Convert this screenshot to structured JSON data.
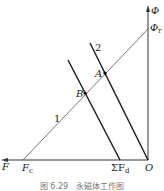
{
  "axes": {
    "y_label": "Φ",
    "y_intercept_label": "Φ",
    "y_intercept_sub": "r",
    "x_label": "F",
    "x_intercept_label": "F",
    "x_intercept_sub": "c",
    "origin_label": "O",
    "sum_fd_label": "ΣF",
    "sum_fd_sub": "d"
  },
  "lines": {
    "line1_label": "1",
    "line2_label": "2"
  },
  "points": {
    "a_label": "A",
    "b_label": "B"
  },
  "caption": "图 6.29　永磁体工作图"
}
